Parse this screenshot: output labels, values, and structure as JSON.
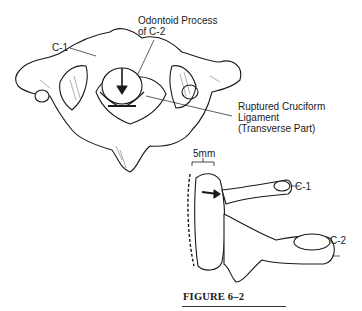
{
  "figure": {
    "caption": "FIGURE 6–2",
    "labels": {
      "odontoid_line1": "Odontoid Process",
      "odontoid_line2": "of C-2",
      "c1_top": "C-1",
      "ligament_line1": "Ruptured Cruciform",
      "ligament_line2": "Ligament",
      "ligament_line3": "(Transverse Part)",
      "measurement": "5mm",
      "c1_side": "C-1",
      "c2_side": "C-2"
    },
    "colors": {
      "ink": "#1a1a1a",
      "background": "#ffffff"
    }
  }
}
